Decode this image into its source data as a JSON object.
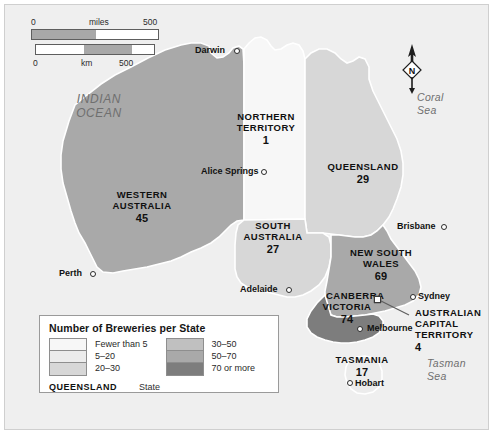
{
  "map": {
    "title": "Number of Breweries per State",
    "background_color": "#efefef",
    "ocean_labels": [
      {
        "name": "indian-ocean",
        "lines": [
          "INDIAN",
          "OCEAN"
        ]
      },
      {
        "name": "coral-sea",
        "lines": [
          "Coral",
          "Sea"
        ]
      },
      {
        "name": "tasman-sea",
        "lines": [
          "Tasman",
          "Sea"
        ]
      }
    ],
    "compass": {
      "label": "N"
    },
    "scalebar": {
      "miles": {
        "unit": "miles",
        "start": "0",
        "end": "500"
      },
      "km": {
        "unit": "km",
        "start": "0",
        "end": "500"
      }
    },
    "states": [
      {
        "name": "western-australia",
        "label_lines": [
          "WESTERN",
          "AUSTRALIA"
        ],
        "count": "45",
        "class": "50-70",
        "fill": "#a9a9a9"
      },
      {
        "name": "northern-territory",
        "label_lines": [
          "NORTHERN",
          "TERRITORY"
        ],
        "count": "1",
        "class": "fewer-than-5",
        "fill": "#f7f7f7"
      },
      {
        "name": "south-australia",
        "label_lines": [
          "SOUTH",
          "AUSTRALIA"
        ],
        "count": "27",
        "class": "20-30",
        "fill": "#d7d7d7"
      },
      {
        "name": "queensland",
        "label_lines": [
          "QUEENSLAND"
        ],
        "count": "29",
        "class": "20-30",
        "fill": "#d7d7d7"
      },
      {
        "name": "new-south-wales",
        "label_lines": [
          "NEW SOUTH",
          "WALES"
        ],
        "count": "69",
        "class": "50-70",
        "fill": "#a9a9a9"
      },
      {
        "name": "victoria",
        "label_lines": [
          "VICTORIA"
        ],
        "count": "74",
        "class": "70-or-more",
        "fill": "#7d7d7d"
      },
      {
        "name": "tasmania",
        "label_lines": [
          "TASMANIA"
        ],
        "count": "17",
        "class": "5-20",
        "fill": "#ececec"
      },
      {
        "name": "australian-capital-territory",
        "label_lines": [
          "AUSTRALIAN",
          "CAPITAL",
          "TERRITORY"
        ],
        "count": "4",
        "class": "fewer-than-5",
        "fill": "#f7f7f7"
      }
    ],
    "cities": [
      {
        "name": "darwin",
        "label": "Darwin",
        "capital": false
      },
      {
        "name": "alice-springs",
        "label": "Alice Springs",
        "capital": false
      },
      {
        "name": "brisbane",
        "label": "Brisbane",
        "capital": false
      },
      {
        "name": "perth",
        "label": "Perth",
        "capital": false
      },
      {
        "name": "adelaide",
        "label": "Adelaide",
        "capital": false
      },
      {
        "name": "sydney",
        "label": "Sydney",
        "capital": false
      },
      {
        "name": "melbourne",
        "label": "Melbourne",
        "capital": false
      },
      {
        "name": "hobart",
        "label": "Hobart",
        "capital": false
      },
      {
        "name": "canberra",
        "label": "CANBERRA",
        "capital": true
      }
    ]
  },
  "legend": {
    "title": "Number of Breweries per State",
    "left_items": [
      {
        "label": "Fewer than 5",
        "color": "#f7f7f7"
      },
      {
        "label": "5–20",
        "color": "#ececec"
      },
      {
        "label": "20–30",
        "color": "#d7d7d7"
      }
    ],
    "right_items": [
      {
        "label": "30–50",
        "color": "#c0c0c0"
      },
      {
        "label": "50–70",
        "color": "#a9a9a9"
      },
      {
        "label": "70 or more",
        "color": "#7d7d7d"
      }
    ],
    "footer_key": "QUEENSLAND",
    "footer_desc": "State"
  }
}
